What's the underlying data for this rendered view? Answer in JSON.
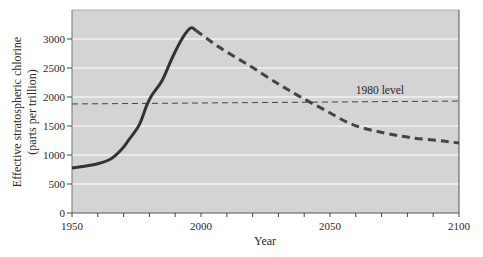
{
  "chart_data": {
    "type": "line",
    "title": "",
    "xlabel": "Year",
    "ylabel": "Effective stratospheric chlorine",
    "ylabel_sub": "(parts per trillion)",
    "xlim": [
      1950,
      2100
    ],
    "ylim": [
      0,
      3500
    ],
    "x_ticks": [
      1950,
      2000,
      2050,
      2100
    ],
    "x_minor_step": 10,
    "y_ticks": [
      0,
      500,
      1000,
      1500,
      2000,
      2500,
      3000
    ],
    "grid": {
      "horizontal": true,
      "vertical": false,
      "color": "#ffffff"
    },
    "plot_background": "#d4d4d4",
    "series": [
      {
        "name": "Observed",
        "style": "solid",
        "color": "#333333",
        "x": [
          1950,
          1960,
          1965,
          1969,
          1972,
          1976,
          1979,
          1981,
          1985,
          1989,
          1993,
          1996,
          1998
        ],
        "values": [
          775,
          850,
          930,
          1085,
          1260,
          1515,
          1860,
          2035,
          2290,
          2690,
          3030,
          3190,
          3150
        ]
      },
      {
        "name": "Projected",
        "style": "dashed",
        "color": "#444444",
        "x": [
          1998,
          2007,
          2019,
          2030,
          2038,
          2048,
          2059,
          2071,
          2082,
          2094,
          2100
        ],
        "values": [
          3150,
          2860,
          2535,
          2225,
          2015,
          1775,
          1520,
          1380,
          1295,
          1240,
          1205
        ]
      }
    ],
    "reference_lines": [
      {
        "label": "1980 level",
        "y_start": 1880,
        "y_end": 1930,
        "style": "dashed",
        "color": "#444444"
      }
    ],
    "annotations": [
      {
        "text": "1980 level",
        "x": 2060,
        "y": 2050
      }
    ]
  }
}
